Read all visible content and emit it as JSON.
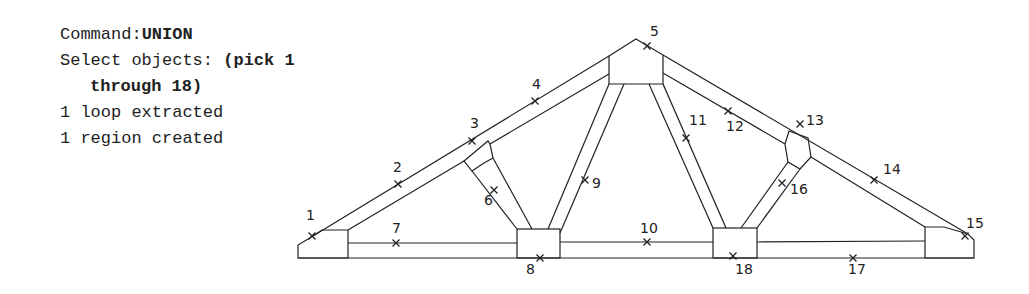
{
  "command_log": {
    "command_prefix": "Command:",
    "command_name": "UNION",
    "select_prefix": "Select objects: ",
    "select_action_1": "(pick 1",
    "select_action_2": "through 18)",
    "result_1": "1 loop extracted",
    "result_2": "1 region created"
  },
  "diagram": {
    "pick_labels": [
      "1",
      "2",
      "3",
      "4",
      "5",
      "6",
      "7",
      "8",
      "9",
      "10",
      "11",
      "12",
      "13",
      "14",
      "15",
      "16",
      "17",
      "18"
    ]
  }
}
